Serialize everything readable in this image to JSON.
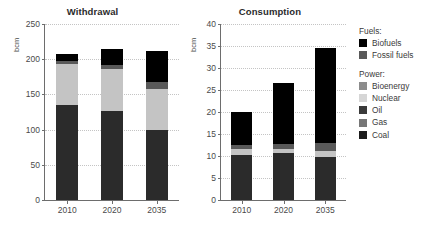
{
  "chart_data": [
    {
      "type": "bar",
      "title": "Withdrawal",
      "xlabel": "",
      "ylabel": "bcm",
      "categories": [
        "2010",
        "2020",
        "2035"
      ],
      "ylim": [
        0,
        250
      ],
      "yticks": [
        0,
        50,
        100,
        150,
        200,
        250
      ],
      "grid": true,
      "stacked": true,
      "legend_position": "right",
      "series": [
        {
          "name": "Coal",
          "values": [
            135,
            126,
            99
          ],
          "color": "#2b2b2b"
        },
        {
          "name": "Nuclear",
          "values": [
            58,
            60,
            58
          ],
          "color": "#c4c4c4"
        },
        {
          "name": "Fossil fuels",
          "values": [
            5,
            6,
            11
          ],
          "color": "#595959"
        },
        {
          "name": "Biofuels",
          "values": [
            10,
            23,
            44
          ],
          "color": "#000000"
        }
      ],
      "totals": [
        208,
        215,
        212
      ]
    },
    {
      "type": "bar",
      "title": "Consumption",
      "xlabel": "",
      "ylabel": "bcm",
      "categories": [
        "2010",
        "2020",
        "2035"
      ],
      "ylim": [
        0,
        40
      ],
      "yticks": [
        0,
        5,
        10,
        15,
        20,
        25,
        30,
        35,
        40
      ],
      "grid": true,
      "stacked": true,
      "legend_position": "right",
      "series": [
        {
          "name": "Coal",
          "values": [
            10.2,
            10.6,
            9.7
          ],
          "color": "#2b2b2b"
        },
        {
          "name": "Nuclear",
          "values": [
            1.3,
            1.1,
            1.5
          ],
          "color": "#c4c4c4"
        },
        {
          "name": "Fossil fuels",
          "values": [
            1.0,
            1.0,
            1.8
          ],
          "color": "#595959"
        },
        {
          "name": "Biofuels",
          "values": [
            7.5,
            13.8,
            21.5
          ],
          "color": "#000000"
        }
      ],
      "totals": [
        20.0,
        26.5,
        34.5
      ]
    }
  ],
  "panels": {
    "left": {
      "title": "Withdrawal",
      "unit": "bcm",
      "ytick_labels": [
        "0",
        "50",
        "100",
        "150",
        "200",
        "250"
      ],
      "xtick_labels": [
        "2010",
        "2020",
        "2035"
      ]
    },
    "right": {
      "title": "Consumption",
      "unit": "bcm",
      "ytick_labels": [
        "0",
        "5",
        "10",
        "15",
        "20",
        "25",
        "30",
        "35",
        "40"
      ],
      "xtick_labels": [
        "2010",
        "2020",
        "2035"
      ]
    }
  },
  "legend": {
    "group_fuels_header": "Fuels:",
    "group_power_header": "Power:",
    "fuels": [
      {
        "label": "Biofuels",
        "color": "#000000"
      },
      {
        "label": "Fossil fuels",
        "color": "#595959"
      }
    ],
    "power": [
      {
        "label": "Bioenergy",
        "color": "#8c8c8c"
      },
      {
        "label": "Nuclear",
        "color": "#d6d6d6"
      },
      {
        "label": "Oil",
        "color": "#3a3a3a"
      },
      {
        "label": "Gas",
        "color": "#777777"
      },
      {
        "label": "Coal",
        "color": "#1c1c1c"
      }
    ]
  },
  "colors": {
    "axis": "#6d6d6d",
    "grid": "#c4c4c4",
    "text": "#3a3a3a",
    "background": "#ffffff"
  }
}
